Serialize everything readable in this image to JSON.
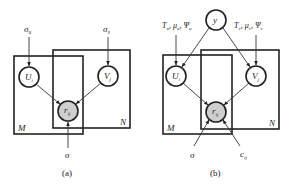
{
  "panels": [
    {
      "caption": "(a)",
      "plates": {
        "M": "M",
        "N": "N"
      },
      "nodes": {
        "U": {
          "main": "U",
          "sub": "i"
        },
        "V": {
          "main": "V",
          "sub": "j"
        },
        "R": {
          "main": "r",
          "sub": "ij"
        }
      },
      "params": {
        "sigma_u": {
          "main": "σ",
          "sub": "u"
        },
        "sigma_v": {
          "main": "σ",
          "sub": "v"
        },
        "sigma": "σ"
      }
    },
    {
      "caption": "(b)",
      "plates": {
        "M": "M",
        "N": "N"
      },
      "nodes": {
        "Y": "y",
        "U": {
          "main": "U",
          "sub": "i"
        },
        "V": {
          "main": "V",
          "sub": "j"
        },
        "R": {
          "main": "r",
          "sub": "ij"
        }
      },
      "params": {
        "prior_u": {
          "T": "T",
          "T_sub": "u",
          "mu": "μ",
          "mu_sub": "u",
          "psi": "Ψ",
          "psi_sub": "u",
          "sep": ", "
        },
        "prior_v": {
          "T": "T",
          "T_sub": "v",
          "mu": "μ",
          "mu_sub": "v",
          "psi": "Ψ",
          "psi_sub": "v",
          "sep": ", "
        },
        "sigma": "σ",
        "c": {
          "main": "c",
          "sub": "ij"
        }
      }
    }
  ],
  "colors": {
    "stroke": "#222222",
    "observed_fill": "#cfcfcf",
    "background": "#ffffff"
  }
}
